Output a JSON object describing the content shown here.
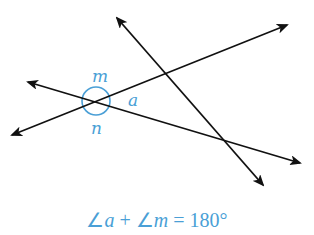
{
  "diagram": {
    "labels": {
      "m": "m",
      "a": "a",
      "n": "n"
    },
    "equation": {
      "angle_sym": "∠",
      "var1": "a",
      "plus": " + ",
      "var2": "m",
      "equals": " = ",
      "value": "180°"
    },
    "colors": {
      "line": "#111111",
      "accent": "#4a9fd6"
    },
    "lines": [
      {
        "name": "line-1",
        "x1": 12,
        "y1": 135,
        "x2": 287,
        "y2": 25
      },
      {
        "name": "line-2",
        "x1": 28,
        "y1": 82,
        "x2": 300,
        "y2": 163
      },
      {
        "name": "line-3",
        "x1": 117,
        "y1": 18,
        "x2": 263,
        "y2": 185
      }
    ]
  }
}
